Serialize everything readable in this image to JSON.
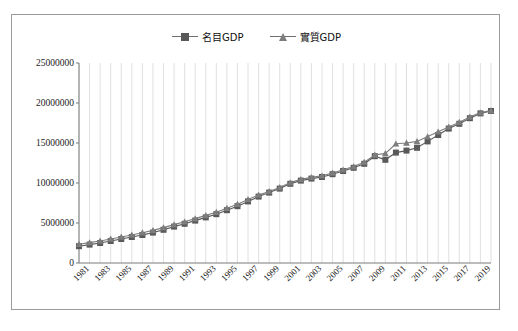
{
  "chart_data": {
    "type": "line",
    "title": "",
    "xlabel": "",
    "ylabel": "",
    "ylim": [
      0,
      25000000
    ],
    "ytick_values": [
      0,
      5000000,
      10000000,
      15000000,
      20000000,
      25000000
    ],
    "ytick_labels": [
      "0",
      "5000000",
      "10000000",
      "15000000",
      "20000000",
      "25000000"
    ],
    "grid": "vertical-only",
    "legend_position": "top-center",
    "x": [
      1980,
      1981,
      1982,
      1983,
      1984,
      1985,
      1986,
      1987,
      1988,
      1989,
      1990,
      1991,
      1992,
      1993,
      1994,
      1995,
      1996,
      1997,
      1998,
      1999,
      2000,
      2001,
      2002,
      2003,
      2004,
      2005,
      2006,
      2007,
      2008,
      2009,
      2010,
      2011,
      2012,
      2013,
      2014,
      2015,
      2016,
      2017,
      2018,
      2019
    ],
    "xtick_labels": [
      "1981",
      "1983",
      "1985",
      "1987",
      "1989",
      "1991",
      "1993",
      "1995",
      "1997",
      "1999",
      "2001",
      "2003",
      "2005",
      "2007",
      "2009",
      "2011",
      "2013",
      "2015",
      "2017",
      "2019"
    ],
    "series": [
      {
        "name": "名目GDP",
        "marker": "square",
        "color": "#595959",
        "values": [
          2100000,
          2300000,
          2500000,
          2750000,
          3000000,
          3250000,
          3500000,
          3800000,
          4150000,
          4550000,
          4900000,
          5300000,
          5700000,
          6100000,
          6600000,
          7100000,
          7700000,
          8300000,
          8800000,
          9300000,
          9900000,
          10300000,
          10550000,
          10750000,
          11100000,
          11500000,
          11900000,
          12400000,
          13350000,
          12900000,
          13800000,
          14050000,
          14400000,
          15200000,
          16000000,
          16800000,
          17400000,
          18100000,
          18700000,
          19000000
        ]
      },
      {
        "name": "實質GDP",
        "marker": "triangle",
        "color": "#7d7d7d",
        "values": [
          2350000,
          2550000,
          2750000,
          3000000,
          3250000,
          3500000,
          3780000,
          4080000,
          4420000,
          4800000,
          5150000,
          5550000,
          5950000,
          6350000,
          6850000,
          7350000,
          7950000,
          8500000,
          8950000,
          9450000,
          10050000,
          10450000,
          10700000,
          10900000,
          11250000,
          11650000,
          12050000,
          12600000,
          13500000,
          13700000,
          14900000,
          15000000,
          15200000,
          15800000,
          16400000,
          17000000,
          17600000,
          18250000,
          18800000,
          19050000
        ]
      }
    ]
  },
  "legend": {
    "entries": [
      {
        "label": "名目GDP"
      },
      {
        "label": "實質GDP"
      }
    ]
  }
}
